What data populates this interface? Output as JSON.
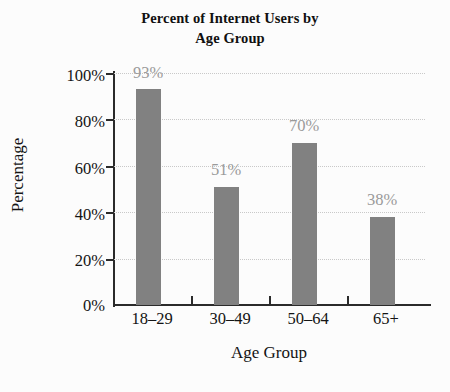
{
  "chart_data": {
    "type": "bar",
    "title": "Percent of Internet Users by Age Group",
    "title_lines": [
      "Percent of Internet Users by",
      "Age Group"
    ],
    "categories": [
      "18–29",
      "30–49",
      "50–64",
      "65+"
    ],
    "values": [
      93,
      51,
      70,
      38
    ],
    "value_labels": [
      "93%",
      "51%",
      "70%",
      "38%"
    ],
    "xlabel": "Age Group",
    "ylabel": "Percentage",
    "ylim": [
      0,
      100
    ],
    "ytick_values": [
      0,
      20,
      40,
      60,
      80,
      100
    ],
    "ytick_labels": [
      "0%",
      "20%",
      "40%",
      "60%",
      "80%",
      "100%"
    ],
    "grid": true,
    "grid_axis": "y",
    "legend": false,
    "bar_color": "#818181",
    "label_color": "#9a9a9a",
    "axis_color": "#2b2b2b",
    "grid_color": "#c9c9c9",
    "background_color": "#fcfcfc"
  }
}
